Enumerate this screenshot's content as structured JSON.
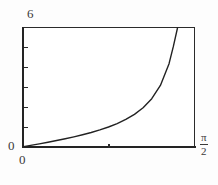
{
  "figure": {
    "background_color": "#fdfdfd",
    "plot_background_color": "#ffffff",
    "frame_color": "#2b2b2b",
    "curve_color": "#222222"
  },
  "labels": {
    "y_max": "6",
    "y_min": "0",
    "x_min": "0",
    "x_max_numerator": "π",
    "x_max_denominator": "2"
  },
  "chart_data": {
    "type": "line",
    "title": "",
    "xlabel": "",
    "ylabel": "",
    "xlim": [
      0,
      1.5707963
    ],
    "ylim": [
      0,
      6
    ],
    "xtick_labels": [
      "0",
      "π/2"
    ],
    "ytick_labels": [
      "0",
      "6"
    ],
    "x_tick_count": 1,
    "y_tick_count": 5,
    "grid": false,
    "legend": false,
    "series": [
      {
        "name": "tan(x)",
        "x": [
          0.0,
          0.0785,
          0.1571,
          0.2356,
          0.3142,
          0.3927,
          0.4712,
          0.5498,
          0.6283,
          0.7069,
          0.7854,
          0.8639,
          0.9425,
          1.021,
          1.0996,
          1.1781,
          1.2566,
          1.3352,
          1.3744,
          1.4137,
          1.4399,
          1.4661,
          1.4923,
          1.5053
        ],
        "y": [
          0.0,
          0.0787,
          0.1584,
          0.2401,
          0.3249,
          0.4142,
          0.5095,
          0.6128,
          0.7265,
          0.8541,
          1.0,
          1.1708,
          1.3764,
          1.6319,
          1.9626,
          2.4142,
          3.0777,
          4.1653,
          5.0273,
          6.0,
          6.0,
          6.0,
          6.0,
          6.0
        ]
      }
    ]
  }
}
